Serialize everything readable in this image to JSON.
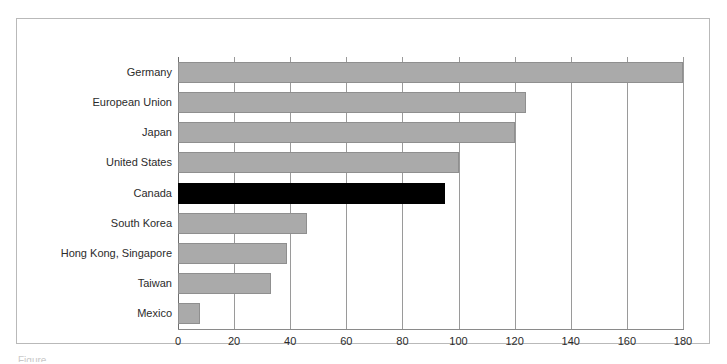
{
  "chart_data": {
    "type": "bar",
    "orientation": "horizontal",
    "title": "",
    "subtitle": "",
    "xlabel": "",
    "ylabel": "",
    "categories": [
      "Germany",
      "European Union",
      "Japan",
      "United States",
      "Canada",
      "South Korea",
      "Hong Kong, Singapore",
      "Taiwan",
      "Mexico"
    ],
    "values": [
      180,
      124,
      120,
      100,
      95,
      46,
      39,
      33,
      8
    ],
    "xlim": [
      0,
      180
    ],
    "xticks": [
      0,
      20,
      40,
      60,
      80,
      100,
      120,
      140,
      160,
      180
    ],
    "xtick_labels": [
      "0",
      "20",
      "40",
      "60",
      "80",
      "100",
      "120",
      "140",
      "160",
      "180"
    ],
    "grid": "vertical",
    "legend": "none",
    "highlight_category": "Canada",
    "colors": {
      "bar": "#aaaaaa",
      "bar_edge": "#8f8f8f",
      "highlight_bar": "#000000",
      "gridline": "#9a9a9a",
      "axis": "#6e6e6e",
      "frame": "#b9b9b9",
      "text": "#2b2b2b",
      "background": "#ffffff"
    }
  },
  "caption": {
    "partial_text": "Figure"
  }
}
